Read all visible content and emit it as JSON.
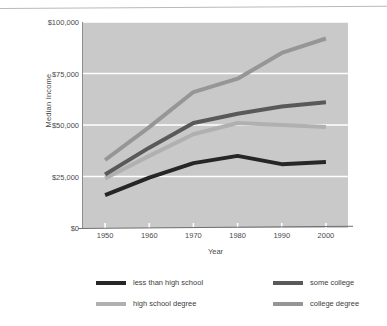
{
  "chart_data": {
    "type": "line",
    "title": "",
    "xlabel": "Year",
    "ylabel": "Median Income",
    "x": [
      1950,
      1960,
      1970,
      1980,
      1990,
      2000
    ],
    "xtick_labels": [
      "1950",
      "1960",
      "1970",
      "1980",
      "1990",
      "2000"
    ],
    "ytick_labels": [
      "$0",
      "$25,000",
      "$50,000",
      "$75,000",
      "$100,000"
    ],
    "yticks": [
      0,
      25000,
      50000,
      75000,
      100000
    ],
    "ylim": [
      0,
      100000
    ],
    "xlim": [
      1945,
      2005
    ],
    "grid": "horizontal-white",
    "legend_position": "below-plot-two-columns",
    "plot_background": "#c9c9c9",
    "series": [
      {
        "name": "less than high school",
        "color": "#262626",
        "values": [
          16000,
          24500,
          31500,
          35000,
          31000,
          32000
        ]
      },
      {
        "name": "high school degree",
        "color": "#b0b0b0",
        "values": [
          24000,
          35000,
          45500,
          51000,
          50000,
          49000
        ]
      },
      {
        "name": "some college",
        "color": "#595959",
        "values": [
          26000,
          39000,
          51000,
          55500,
          59000,
          61000
        ]
      },
      {
        "name": "college degree",
        "color": "#969696",
        "values": [
          33000,
          49000,
          66000,
          72500,
          85000,
          92000
        ]
      }
    ]
  },
  "legend": {
    "items": [
      {
        "label": "less than high school",
        "color": "#262626"
      },
      {
        "label": "high school degree",
        "color": "#b0b0b0"
      },
      {
        "label": "some college",
        "color": "#595959"
      },
      {
        "label": "college degree",
        "color": "#969696"
      }
    ]
  }
}
